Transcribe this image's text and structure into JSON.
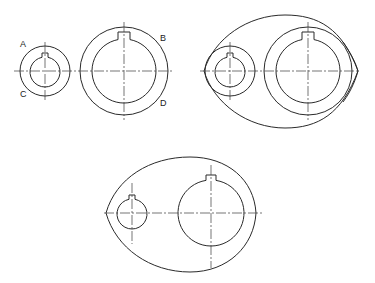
{
  "diagram": {
    "type": "mechanical-drawing",
    "figures": [
      {
        "id": "figure-1",
        "step": "Draw bosses with tangent points",
        "small_boss": {
          "center": [
            45,
            71
          ],
          "outer_r": 25,
          "bore_r": 15,
          "keyway": true
        },
        "large_boss": {
          "center": [
            124,
            71
          ],
          "outer_r": 44,
          "bore_r": 32,
          "keyway": true
        },
        "labels": [
          {
            "text": "A",
            "x": 20,
            "y": 40
          },
          {
            "text": "C",
            "x": 20,
            "y": 90
          },
          {
            "text": "B",
            "x": 160,
            "y": 34
          },
          {
            "text": "D",
            "x": 160,
            "y": 99
          }
        ]
      },
      {
        "id": "figure-2",
        "step": "Draw enveloping arcs tangent to bosses",
        "small_boss": {
          "center": [
            230,
            71
          ],
          "outer_r": 25,
          "bore_r": 15,
          "keyway": true
        },
        "large_boss": {
          "center": [
            308,
            71
          ],
          "outer_r": 44,
          "bore_r": 32,
          "keyway": true
        },
        "envelope": {
          "left": 203,
          "right": 358,
          "top": 15,
          "bottom": 128
        }
      },
      {
        "id": "figure-3",
        "step": "Finished outline",
        "small_bore": {
          "center": [
            132,
            213
          ],
          "r": 15,
          "keyway": true
        },
        "large_bore": {
          "center": [
            211,
            213
          ],
          "r": 33,
          "keyway": true
        },
        "envelope": {
          "left": 106,
          "right": 256,
          "top": 157,
          "bottom": 272
        }
      }
    ]
  },
  "labels": {
    "a": "A",
    "b": "B",
    "c": "C",
    "d": "D"
  }
}
